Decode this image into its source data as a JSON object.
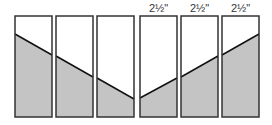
{
  "diagram": {
    "colors": {
      "fill": "#c4c4c4",
      "stroke": "#333333",
      "background": "#ffffff"
    },
    "strips": [
      {
        "x": 15,
        "y_left": 34,
        "y_right": 55,
        "label": ""
      },
      {
        "x": 56,
        "y_left": 56,
        "y_right": 77,
        "label": ""
      },
      {
        "x": 97,
        "y_left": 78,
        "y_right": 99,
        "label": ""
      },
      {
        "x": 140,
        "y_left": 98,
        "y_right": 78,
        "label": "2½\""
      },
      {
        "x": 181,
        "y_left": 77,
        "y_right": 56,
        "label": "2½\""
      },
      {
        "x": 222,
        "y_left": 55,
        "y_right": 34,
        "label": "2½\""
      }
    ],
    "strip_width": 37,
    "strip_top": 16,
    "strip_bottom": 117
  }
}
